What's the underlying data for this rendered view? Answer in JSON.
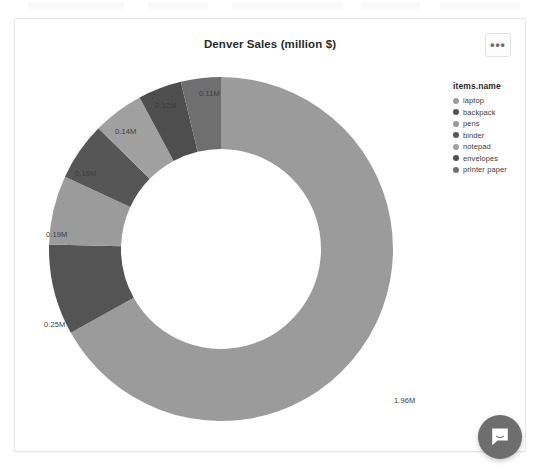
{
  "card": {
    "title": "Denver Sales (million $)",
    "menu_label": "•••"
  },
  "legend": {
    "title": "items.name"
  },
  "chat": {
    "icon": "chat-bubble-icon"
  },
  "chart_data": {
    "type": "pie",
    "variant": "donut",
    "title": "Denver Sales (million $)",
    "legend_title": "items.name",
    "legend_position": "right",
    "value_unit": "million $",
    "categories": [
      "laptop",
      "backpack",
      "pens",
      "binder",
      "notepad",
      "envelopes",
      "printer paper"
    ],
    "values": [
      1.96,
      0.25,
      0.19,
      0.16,
      0.14,
      0.12,
      0.11
    ],
    "labels": [
      "1.96M",
      "0.25M",
      "0.19M",
      "0.16M",
      "0.14M",
      "0.12M",
      "0.11M"
    ],
    "colors": [
      "#9b9b9b",
      "#545454",
      "#9b9b9b",
      "#565656",
      "#a0a0a0",
      "#4e4e4e",
      "#6f6f6f"
    ],
    "total": 2.93,
    "xlabel": "",
    "ylabel": "",
    "grid": false
  }
}
